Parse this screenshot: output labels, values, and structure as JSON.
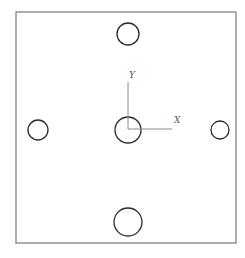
{
  "diagram": {
    "type": "plate-hole-layout",
    "colors": {
      "background": "#ffffff",
      "plate_stroke": "#8a8a8a",
      "hole_stroke": "#2a2a2a",
      "axis_stroke": "#8a8a8a",
      "label": "#555555"
    },
    "plate": {
      "x": 16,
      "y": 12,
      "width": 220,
      "height": 231
    },
    "holes": [
      {
        "id": "top",
        "cx": 128,
        "cy": 34,
        "r": 11
      },
      {
        "id": "left",
        "cx": 38,
        "cy": 130,
        "r": 10
      },
      {
        "id": "center",
        "cx": 128,
        "cy": 130,
        "r": 13
      },
      {
        "id": "right",
        "cx": 220,
        "cy": 130,
        "r": 9
      },
      {
        "id": "bottom",
        "cx": 128,
        "cy": 222,
        "r": 14
      }
    ],
    "axes": {
      "origin": {
        "x": 128,
        "y": 129
      },
      "y_end": 82,
      "x_end": 172,
      "x_label": "X",
      "y_label": "Y",
      "x_label_pos": {
        "x": 174,
        "y": 123
      },
      "y_label_pos": {
        "x": 129,
        "y": 78
      }
    }
  }
}
